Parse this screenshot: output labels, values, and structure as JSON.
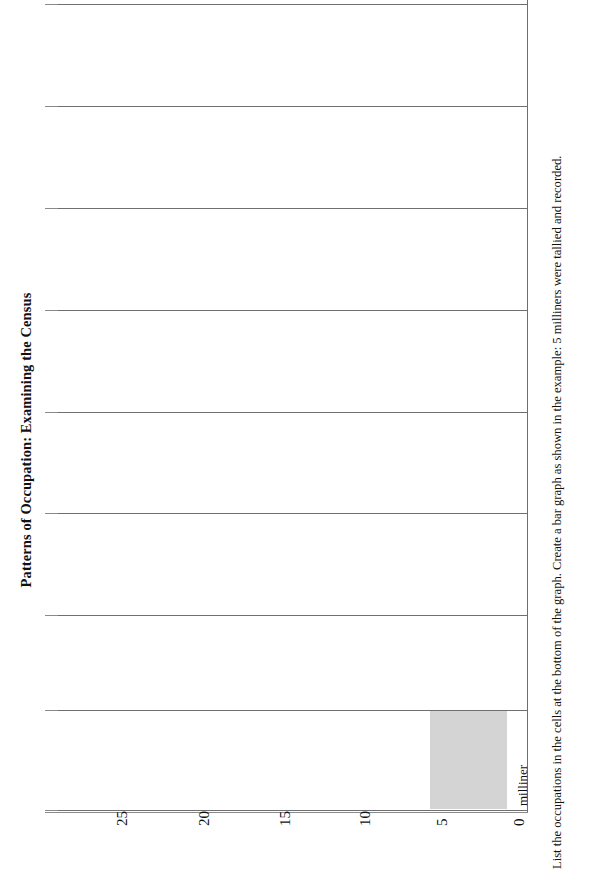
{
  "document": {
    "title": "Patterns of Occupation: Examining the Census",
    "instructions": "List the occupations in the cells at the bottom of the graph. Create a bar graph as shown in the example: 5 milliners were tallied and recorded."
  },
  "chart_data": {
    "type": "bar",
    "title": "Patterns of Occupation: Examining the Census",
    "orientation": "vertical-page-rotated",
    "categories": [
      "milliner",
      "",
      "",
      "",
      "",
      "",
      "",
      ""
    ],
    "values": [
      5,
      0,
      0,
      0,
      0,
      0,
      0,
      0
    ],
    "xlabel": "",
    "ylabel": "",
    "ylim": [
      0,
      28
    ],
    "tick_labels": [
      "25",
      "20",
      "15",
      "10",
      "5",
      "0"
    ],
    "tick_values": [
      25,
      20,
      15,
      10,
      5,
      0
    ],
    "grid": true,
    "legend": false,
    "bar_color": "#d4d4d4",
    "grid_color": "#6f6f6f",
    "filled_bars": [
      {
        "category": "milliner",
        "value": 5
      }
    ]
  },
  "axis": {
    "ticks": [
      {
        "label": "25",
        "x": 114
      },
      {
        "label": "20",
        "x": 196
      },
      {
        "label": "15",
        "x": 277
      },
      {
        "label": "10",
        "x": 357
      },
      {
        "label": "5",
        "x": 434
      },
      {
        "label": "0",
        "x": 511
      }
    ]
  },
  "grid": {
    "lines_y": [
      4,
      106,
      208,
      310,
      412,
      513,
      615,
      710,
      810
    ]
  },
  "bars": [
    {
      "label": "milliner",
      "value": 5,
      "left": 373,
      "top": 711,
      "width": 77,
      "height": 98,
      "label_x": 458,
      "label_y": 806
    }
  ],
  "colors": {
    "bar_fill": "#d4d4d4",
    "grid_line": "#6f6f6f",
    "axis_line": "#8a8a8a",
    "text": "#111111",
    "page_background": "#ffffff"
  }
}
